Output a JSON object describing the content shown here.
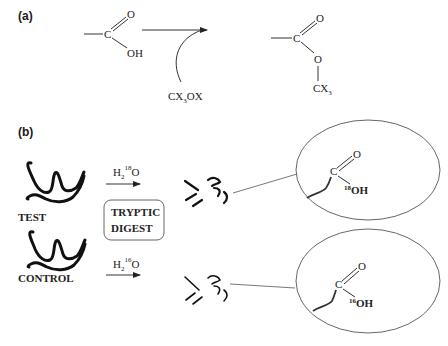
{
  "panel_a": {
    "label": "(a)",
    "reactant": {
      "carbon": "C",
      "carbonyl_o": "O",
      "hydroxyl": "OH"
    },
    "reagent": {
      "text": "CX",
      "sub": "3",
      "tail": "OX"
    },
    "product": {
      "carbon": "C",
      "carbonyl_o": "O",
      "ester_o": "O",
      "group": "CX",
      "group_sub": "3"
    }
  },
  "panel_b": {
    "label": "(b)",
    "samples": {
      "test": "TEST",
      "control": "CONTROL"
    },
    "box": {
      "line1": "TRYPTIC",
      "line2": "DIGEST"
    },
    "reagent_top": {
      "h": "H",
      "h_sub": "2",
      "iso": "18",
      "o": "O"
    },
    "reagent_bottom": {
      "h": "H",
      "h_sub": "2",
      "iso": "16",
      "o": "O"
    },
    "inset_top": {
      "carbon": "C",
      "carbonyl_o": "O",
      "iso": "18",
      "oh": "OH"
    },
    "inset_bottom": {
      "carbon": "C",
      "carbonyl_o": "O",
      "iso": "16",
      "oh": "OH"
    }
  }
}
